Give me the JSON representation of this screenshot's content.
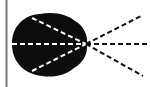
{
  "diagram": {
    "type": "ray-diagram",
    "colors": {
      "background": "#ffffff",
      "blob": "#0d0d0d",
      "outer_dash": "#111111",
      "inner_dash": "#ffffff",
      "border": "#777777"
    },
    "focal_point": {
      "x": 86,
      "y": 44
    },
    "rays": [
      {
        "name": "upper",
        "x2": 143,
        "y2": 15
      },
      {
        "name": "middle",
        "x2": 148,
        "y2": 44
      },
      {
        "name": "lower",
        "x2": 143,
        "y2": 76
      }
    ],
    "inner_rays": [
      {
        "name": "upper",
        "x1": 32,
        "y1": 18
      },
      {
        "name": "middle",
        "x1": 12,
        "y1": 44
      },
      {
        "name": "lower",
        "x1": 32,
        "y1": 71
      }
    ]
  }
}
